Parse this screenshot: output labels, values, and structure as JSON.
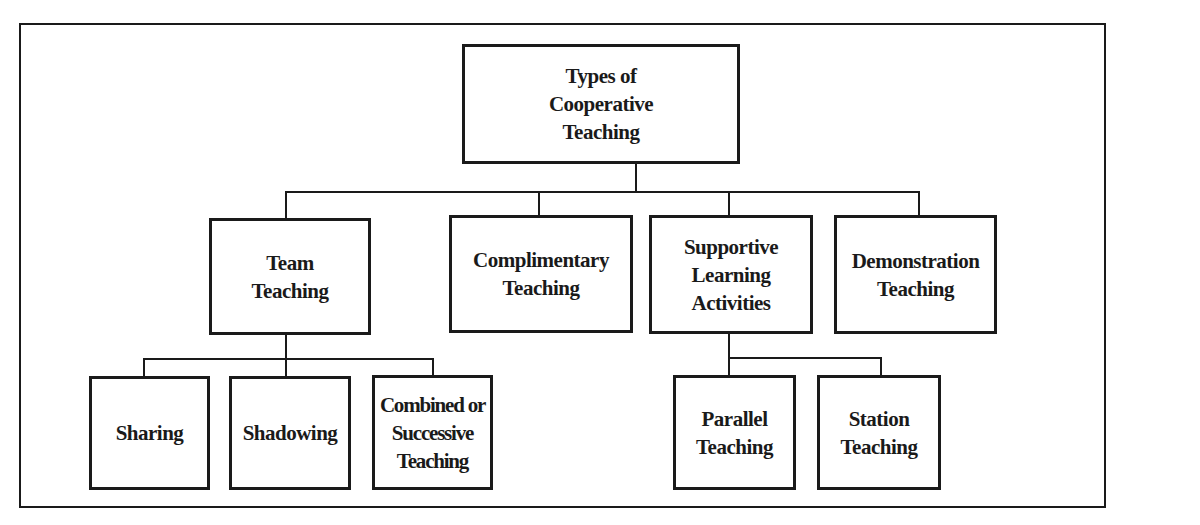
{
  "diagram": {
    "type": "hierarchy-tree",
    "root": {
      "label": "Types of\nCooperative\nTeaching"
    },
    "level1": [
      {
        "label": "Team\nTeaching",
        "children": [
          "Sharing",
          "Shadowing",
          "Combined or\nSuccessive\nTeaching"
        ]
      },
      {
        "label": "Complimentary\nTeaching",
        "children": []
      },
      {
        "label": "Supportive\nLearning\nActivities",
        "children": [
          "Parallel\nTeaching",
          "Station\nTeaching"
        ]
      },
      {
        "label": "Demonstration\nTeaching",
        "children": []
      }
    ],
    "level2": {
      "team_teaching": [
        "Sharing",
        "Shadowing",
        "Combined or\nSuccessive\nTeaching"
      ],
      "supportive_learning": [
        "Parallel\nTeaching",
        "Station\nTeaching"
      ]
    },
    "colors": {
      "stroke": "#1a1a1a",
      "background": "#ffffff"
    }
  }
}
